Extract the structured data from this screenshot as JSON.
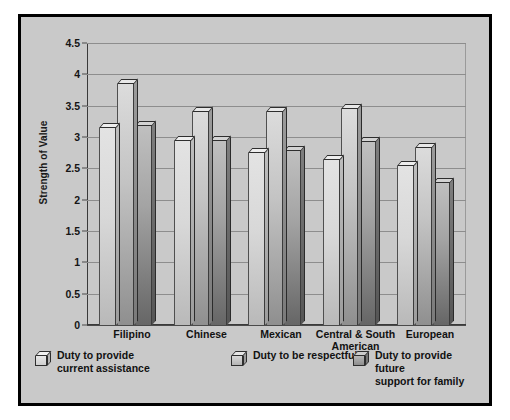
{
  "figure": {
    "background_color": "#c9c9c9",
    "border_color": "#000000",
    "page_background": "#ffffff"
  },
  "chart_data": {
    "type": "bar",
    "title": "",
    "subtitle": "",
    "xlabel": "",
    "ylabel": "Strength of Value",
    "ylim": [
      0,
      4.5
    ],
    "yticks": [
      "0",
      "0.5",
      "1",
      "1.5",
      "2",
      "2.5",
      "3",
      "3.5",
      "4",
      "4.5"
    ],
    "ytick_values": [
      0,
      0.5,
      1,
      1.5,
      2,
      2.5,
      3,
      3.5,
      4,
      4.5
    ],
    "grid": "horizontal",
    "legend_position": "bottom",
    "bar_style": "3d-shaded",
    "categories": [
      "Filipino",
      "Chinese",
      "Mexican",
      "Central & South\nAmerican",
      "European"
    ],
    "series": [
      {
        "name": "Duty to provide\ncurrent assistance",
        "color": "#dcdcdc",
        "values": [
          3.22,
          3.02,
          2.83,
          2.72,
          2.62
        ]
      },
      {
        "name": "Duty to be respectful",
        "color": "#bfbfbf",
        "values": [
          3.93,
          3.48,
          3.48,
          3.52,
          2.9
        ]
      },
      {
        "name": "Duty to provide future\nsupport for family",
        "color": "#8f8f8f",
        "values": [
          3.25,
          3.02,
          2.85,
          3.0,
          2.35
        ]
      }
    ]
  },
  "legend": {
    "items": [
      {
        "label": "Duty to provide\ncurrent assistance",
        "swatch": "bar-swatch-series-1"
      },
      {
        "label": "Duty to be respectful",
        "swatch": "bar-swatch-series-2"
      },
      {
        "label": "Duty to provide future\nsupport for family",
        "swatch": "bar-swatch-series-3"
      }
    ]
  }
}
